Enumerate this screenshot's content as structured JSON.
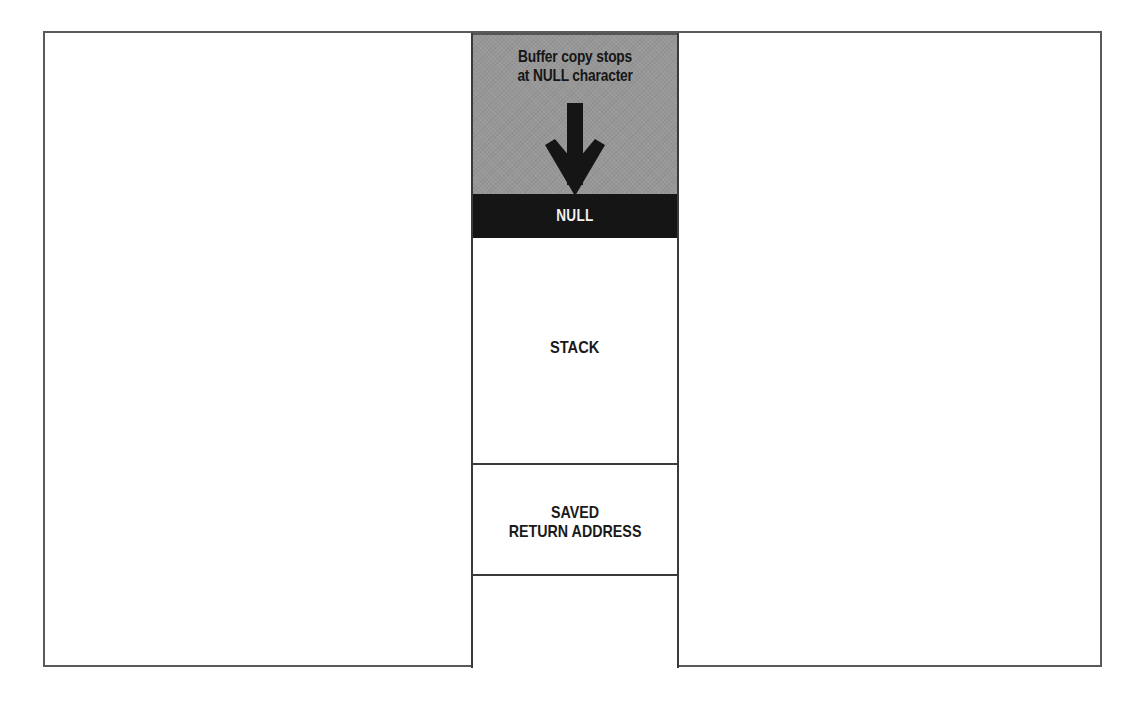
{
  "diagram": {
    "caption": {
      "line1": "Buffer copy stops",
      "line2": "at NULL character"
    },
    "segments": [
      {
        "id": "overflow",
        "label": "",
        "fill": "#979797"
      },
      {
        "id": "null",
        "label": "NULL",
        "fill": "#151515"
      },
      {
        "id": "stack",
        "label": "STACK",
        "fill": "#ffffff"
      },
      {
        "id": "return",
        "label_line1": "SAVED",
        "label_line2": "RETURN ADDRESS",
        "fill": "#ffffff"
      },
      {
        "id": "empty",
        "label": "",
        "fill": "#ffffff"
      }
    ],
    "arrow": {
      "direction": "down",
      "icon": "arrow-down-icon",
      "color": "#151515"
    },
    "colors": {
      "frame": "#5a5a5a",
      "column_border": "#3a3a3a",
      "overflow_fill": "#979797",
      "null_fill": "#151515",
      "null_text": "#f2f2f2",
      "text": "#1a1a1a"
    }
  }
}
